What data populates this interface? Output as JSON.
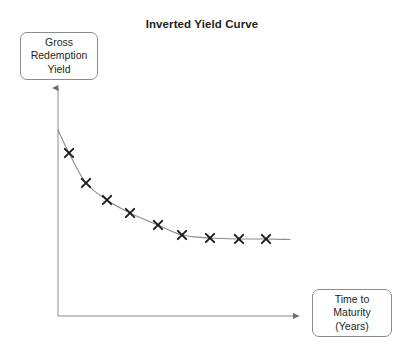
{
  "chart_data": {
    "type": "line",
    "title": "Inverted Yield Curve",
    "xlabel": "Time to Maturity (Years)",
    "ylabel": "Gross Redemption Yield",
    "grid": false,
    "legend": false,
    "axes_style": "arrow-axes, no tick labels, no numeric scale",
    "marker": "x",
    "series": [
      {
        "name": "Inverted Yield Curve",
        "x": [
          1,
          2,
          3,
          4,
          5,
          6,
          7,
          8,
          9
        ],
        "y": [
          8.2,
          6.4,
          5.1,
          4.3,
          3.6,
          3.0,
          2.8,
          2.75,
          2.75
        ],
        "points_px": [
          {
            "x": 69,
            "y": 153
          },
          {
            "x": 86,
            "y": 183
          },
          {
            "x": 107,
            "y": 200
          },
          {
            "x": 130,
            "y": 213
          },
          {
            "x": 158,
            "y": 225
          },
          {
            "x": 182,
            "y": 235
          },
          {
            "x": 210,
            "y": 238
          },
          {
            "x": 239,
            "y": 239
          },
          {
            "x": 266,
            "y": 239
          }
        ]
      }
    ],
    "xlim": [
      0,
      10
    ],
    "ylim": [
      0,
      10
    ]
  },
  "title": {
    "text": "Inverted Yield Curve"
  },
  "y_axis_label": {
    "line1": "Gross",
    "line2": "Redemption",
    "line3": "Yield"
  },
  "x_axis_label": {
    "line1": "Time to",
    "line2": "Maturity",
    "line3": "(Years)"
  },
  "colors": {
    "curve": "#8a8a8a",
    "marker": "#1a1a1a",
    "axis": "#8d8d8d",
    "box_border": "#8d8d8d",
    "text": "#231f20",
    "background": "#ffffff"
  }
}
